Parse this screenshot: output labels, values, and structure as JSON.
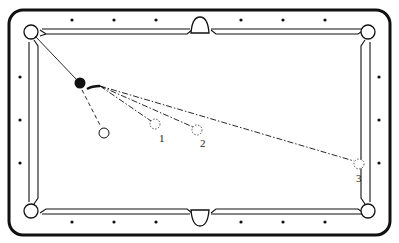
{
  "diagram": {
    "colors": {
      "line": "#111111",
      "cloth": "#ffffff",
      "ghost": "#444444"
    },
    "table": {
      "outer": {
        "x": 9,
        "y": 10,
        "w": 381,
        "h": 225,
        "rx": 14
      },
      "pockets": [
        "top-left",
        "top-middle",
        "top-right",
        "bottom-left",
        "bottom-middle",
        "bottom-right"
      ],
      "diamonds_top_y": 20,
      "diamonds_bottom_y": 222,
      "diamonds_x": [
        72,
        114,
        156,
        241,
        283,
        325
      ],
      "diamonds_left_x": 20,
      "diamonds_right_x": 379,
      "diamonds_side_y": [
        77,
        120,
        163
      ]
    },
    "balls": {
      "cue_ball": {
        "x": 80,
        "y": 83,
        "fill": "solid-black"
      },
      "object_ball": {
        "x": 104,
        "y": 133,
        "fill": "white-outline"
      },
      "ghost_positions": [
        {
          "id": "1",
          "x": 155,
          "y": 124,
          "label": "1"
        },
        {
          "id": "2",
          "x": 197,
          "y": 130,
          "label": "2"
        },
        {
          "id": "3",
          "x": 359,
          "y": 164,
          "label": "3"
        }
      ]
    },
    "paths": {
      "pocket_line": "solid line from top-left pocket to cue ball",
      "object_ball_path": "dashed line from cue ball to object ball",
      "cue_paths": "dash-dot lines from cue ball curving to positions 1, 2, 3"
    },
    "labels": {
      "pos1": "1",
      "pos2": "2",
      "pos3": "3"
    }
  }
}
